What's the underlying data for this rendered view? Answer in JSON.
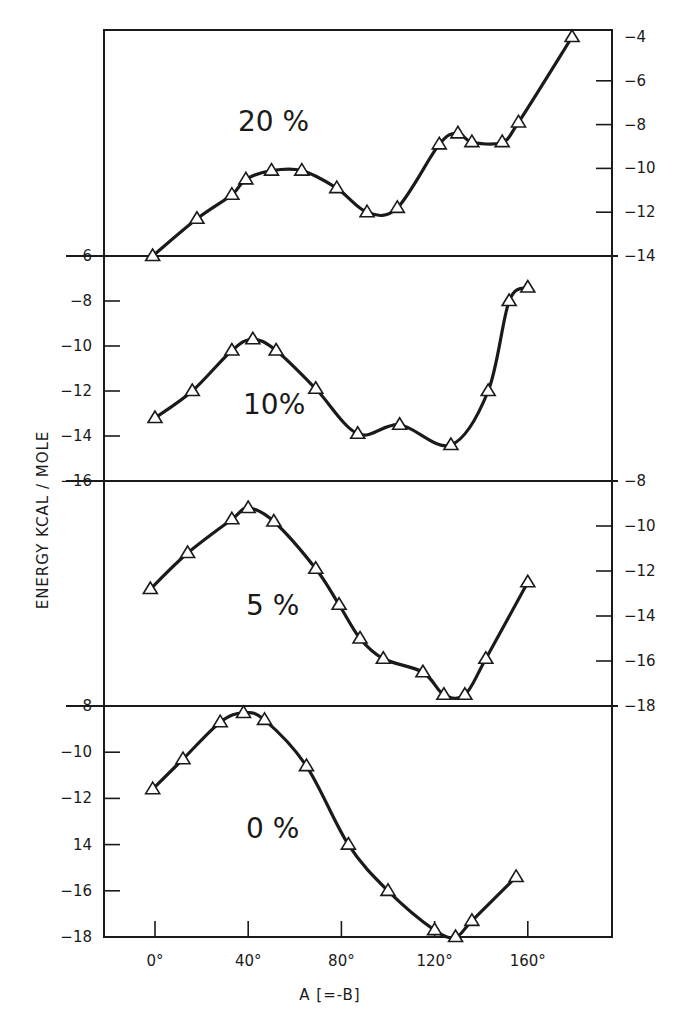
{
  "chart_data": {
    "type": "line",
    "title": "",
    "xlabel": "A [=-B]",
    "ylabel": "ENERGY  KCAL / MOLE",
    "x_ticks": [
      0,
      40,
      80,
      120,
      160
    ],
    "x_tick_labels": [
      "0°",
      "40°",
      "80°",
      "120°",
      "160°"
    ],
    "xlim": [
      -20,
      200
    ],
    "marker": "triangle",
    "grid": false,
    "legend": "none (panel labels inside plots)",
    "panels": [
      {
        "label": "20 %",
        "y_axis_side": "right",
        "ylim": [
          -14,
          -4
        ],
        "y_ticks": [
          -4,
          -6,
          -8,
          -10,
          -12,
          -14
        ],
        "x": [
          -1,
          18,
          33,
          39,
          50,
          63,
          78,
          91,
          104,
          122,
          130,
          136,
          149,
          156,
          179
        ],
        "y": [
          -14.0,
          -12.3,
          -11.2,
          -10.5,
          -10.1,
          -10.1,
          -10.9,
          -12.0,
          -11.8,
          -8.9,
          -8.4,
          -8.8,
          -8.8,
          -7.9,
          -4.0
        ]
      },
      {
        "label": "10%",
        "y_axis_side": "left",
        "ylim": [
          -16,
          -6
        ],
        "y_ticks": [
          -6,
          -8,
          -10,
          -12,
          -14,
          -16
        ],
        "x": [
          0,
          16,
          33,
          42,
          52,
          69,
          87,
          105,
          127,
          143,
          152,
          160
        ],
        "y": [
          -13.2,
          -12.0,
          -10.2,
          -9.7,
          -10.2,
          -11.9,
          -13.9,
          -13.5,
          -14.4,
          -12.0,
          -8.0,
          -7.4
        ]
      },
      {
        "label": "5 %",
        "y_axis_side": "right",
        "ylim": [
          -18,
          -8
        ],
        "y_ticks": [
          -8,
          -10,
          -12,
          -14,
          -16,
          -18
        ],
        "x": [
          -2,
          14,
          33,
          40,
          51,
          69,
          79,
          88,
          98,
          115,
          124,
          133,
          142,
          160
        ],
        "y": [
          -12.8,
          -11.2,
          -9.7,
          -9.2,
          -9.8,
          -11.9,
          -13.5,
          -15.0,
          -15.9,
          -16.5,
          -17.5,
          -17.5,
          -15.9,
          -12.5
        ]
      },
      {
        "label": "0 %",
        "y_axis_side": "left",
        "ylim": [
          -18,
          -8
        ],
        "y_ticks": [
          -8,
          -10,
          -12,
          -14,
          -16,
          -18
        ],
        "y_tick_labels": [
          "-8",
          "-10",
          "-12",
          "14",
          "-16",
          "-18"
        ],
        "x": [
          -1,
          12,
          28,
          38,
          47,
          65,
          83,
          100,
          120,
          129,
          136,
          155
        ],
        "y": [
          -11.6,
          -10.3,
          -8.7,
          -8.3,
          -8.6,
          -10.6,
          -14.0,
          -16.0,
          -17.7,
          -18.0,
          -17.3,
          -15.4
        ]
      }
    ]
  },
  "labels": {
    "xlabel": "A [=-B]",
    "ylabel": "ENERGY  KCAL / MOLE",
    "panel_20": "20 %",
    "panel_10": "10%",
    "panel_5": "5 %",
    "panel_0": "0 %"
  }
}
